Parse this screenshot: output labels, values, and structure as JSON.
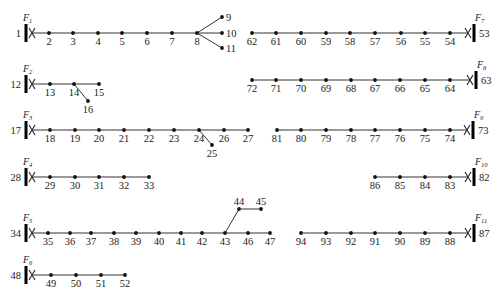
{
  "diagram": {
    "type": "distribution-feeder-topology",
    "feeders": [
      {
        "id": "F1",
        "sub": "1",
        "side": "left",
        "bus": {
          "label": "1",
          "x": 26,
          "y": 33
        },
        "nodes": [
          {
            "l": "2",
            "x": 49
          },
          {
            "l": "3",
            "x": 73
          },
          {
            "l": "4",
            "x": 98
          },
          {
            "l": "5",
            "x": 122
          },
          {
            "l": "6",
            "x": 147
          },
          {
            "l": "7",
            "x": 172
          },
          {
            "l": "8",
            "x": 197
          }
        ],
        "branches": [
          {
            "from": 197,
            "to": {
              "l": "9",
              "x": 222,
              "y": 17
            }
          },
          {
            "from": 197,
            "to": {
              "l": "10",
              "x": 222,
              "y": 33
            }
          },
          {
            "from": 197,
            "to": {
              "l": "11",
              "x": 222,
              "y": 48
            }
          }
        ]
      },
      {
        "id": "F7",
        "sub": "7",
        "side": "right",
        "bus": {
          "label": "53",
          "x": 474,
          "y": 33
        },
        "nodes": [
          {
            "l": "62",
            "x": 252
          },
          {
            "l": "61",
            "x": 276
          },
          {
            "l": "60",
            "x": 301
          },
          {
            "l": "59",
            "x": 326
          },
          {
            "l": "58",
            "x": 350
          },
          {
            "l": "57",
            "x": 375
          },
          {
            "l": "56",
            "x": 401
          },
          {
            "l": "55",
            "x": 425
          },
          {
            "l": "54",
            "x": 450
          }
        ],
        "branches": []
      },
      {
        "id": "F2",
        "sub": "2",
        "side": "left",
        "bus": {
          "label": "12",
          "x": 26,
          "y": 84
        },
        "nodes": [
          {
            "l": "13",
            "x": 50
          },
          {
            "l": "14",
            "x": 74
          },
          {
            "l": "15",
            "x": 99
          }
        ],
        "branches": [
          {
            "from": 74,
            "to": {
              "l": "16",
              "x": 88,
              "y": 101
            }
          }
        ]
      },
      {
        "id": "F8",
        "sub": "8",
        "side": "right",
        "bus": {
          "label": "63",
          "x": 476,
          "y": 80
        },
        "nodes": [
          {
            "l": "72",
            "x": 252
          },
          {
            "l": "71",
            "x": 276
          },
          {
            "l": "70",
            "x": 301
          },
          {
            "l": "69",
            "x": 326
          },
          {
            "l": "68",
            "x": 351
          },
          {
            "l": "67",
            "x": 375
          },
          {
            "l": "66",
            "x": 400
          },
          {
            "l": "65",
            "x": 425
          },
          {
            "l": "64",
            "x": 450
          }
        ],
        "branches": []
      },
      {
        "id": "F3",
        "sub": "3",
        "side": "left",
        "bus": {
          "label": "17",
          "x": 26,
          "y": 130
        },
        "nodes": [
          {
            "l": "18",
            "x": 50
          },
          {
            "l": "19",
            "x": 75
          },
          {
            "l": "20",
            "x": 99
          },
          {
            "l": "21",
            "x": 124
          },
          {
            "l": "22",
            "x": 149
          },
          {
            "l": "23",
            "x": 174
          },
          {
            "l": "24",
            "x": 199
          },
          {
            "l": "26",
            "x": 224
          },
          {
            "l": "27",
            "x": 248
          }
        ],
        "branches": [
          {
            "from": 199,
            "to": {
              "l": "25",
              "x": 212,
              "y": 145
            }
          }
        ]
      },
      {
        "id": "F9",
        "sub": "9",
        "side": "right",
        "bus": {
          "label": "73",
          "x": 473,
          "y": 130
        },
        "nodes": [
          {
            "l": "81",
            "x": 277
          },
          {
            "l": "80",
            "x": 301
          },
          {
            "l": "79",
            "x": 326
          },
          {
            "l": "78",
            "x": 351
          },
          {
            "l": "77",
            "x": 375
          },
          {
            "l": "76",
            "x": 400
          },
          {
            "l": "75",
            "x": 425
          },
          {
            "l": "74",
            "x": 450
          }
        ],
        "branches": []
      },
      {
        "id": "F4",
        "sub": "4",
        "side": "left",
        "bus": {
          "label": "28",
          "x": 26,
          "y": 177
        },
        "nodes": [
          {
            "l": "29",
            "x": 50
          },
          {
            "l": "30",
            "x": 75
          },
          {
            "l": "31",
            "x": 99
          },
          {
            "l": "32",
            "x": 124
          },
          {
            "l": "33",
            "x": 149
          }
        ],
        "branches": []
      },
      {
        "id": "F10",
        "sub": "10",
        "side": "right",
        "bus": {
          "label": "82",
          "x": 474,
          "y": 177
        },
        "nodes": [
          {
            "l": "86",
            "x": 375
          },
          {
            "l": "85",
            "x": 400
          },
          {
            "l": "84",
            "x": 425
          },
          {
            "l": "83",
            "x": 450
          }
        ],
        "branches": []
      },
      {
        "id": "F5",
        "sub": "5",
        "side": "left",
        "bus": {
          "label": "34",
          "x": 26,
          "y": 233
        },
        "nodes": [
          {
            "l": "35",
            "x": 48
          },
          {
            "l": "36",
            "x": 70
          },
          {
            "l": "37",
            "x": 91
          },
          {
            "l": "38",
            "x": 114
          },
          {
            "l": "39",
            "x": 136
          },
          {
            "l": "40",
            "x": 159
          },
          {
            "l": "41",
            "x": 181
          },
          {
            "l": "42",
            "x": 202
          },
          {
            "l": "43",
            "x": 225
          },
          {
            "l": "46",
            "x": 248
          },
          {
            "l": "47",
            "x": 270
          }
        ],
        "branches": [
          {
            "from": 225,
            "to": {
              "l": "44",
              "x": 239,
              "y": 209
            },
            "then": {
              "l": "45",
              "x": 261,
              "y": 209
            }
          }
        ]
      },
      {
        "id": "F11",
        "sub": "11",
        "side": "right",
        "bus": {
          "label": "87",
          "x": 474,
          "y": 233
        },
        "nodes": [
          {
            "l": "94",
            "x": 301
          },
          {
            "l": "93",
            "x": 326
          },
          {
            "l": "92",
            "x": 351
          },
          {
            "l": "91",
            "x": 375
          },
          {
            "l": "90",
            "x": 400
          },
          {
            "l": "89",
            "x": 425
          },
          {
            "l": "88",
            "x": 450
          }
        ],
        "branches": []
      },
      {
        "id": "F6",
        "sub": "6",
        "side": "left",
        "bus": {
          "label": "48",
          "x": 26,
          "y": 275
        },
        "nodes": [
          {
            "l": "49",
            "x": 51
          },
          {
            "l": "50",
            "x": 76
          },
          {
            "l": "51",
            "x": 101
          },
          {
            "l": "52",
            "x": 125
          }
        ],
        "branches": []
      }
    ]
  }
}
